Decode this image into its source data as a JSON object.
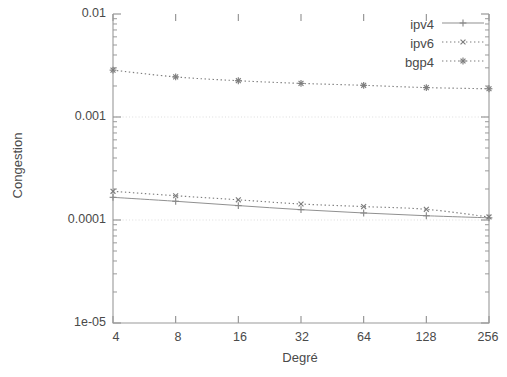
{
  "chart_data": {
    "type": "line",
    "title": "",
    "xlabel": "Degré",
    "ylabel": "Congestion",
    "xscale": "log2",
    "yscale": "log10",
    "xlim": [
      4,
      256
    ],
    "ylim": [
      1e-05,
      0.01
    ],
    "xticks": [
      "4",
      "8",
      "16",
      "32",
      "64",
      "128",
      "256"
    ],
    "x": [
      4,
      8,
      16,
      32,
      64,
      128,
      256
    ],
    "yticks": [
      "1e-05",
      "0.0001",
      "0.001",
      "0.01"
    ],
    "ytick_values": [
      1e-05,
      0.0001,
      0.001,
      0.01
    ],
    "grid": "horizontal-major-faint",
    "legend_position": "top-right-inside",
    "series": [
      {
        "name": "ipv4",
        "style": "solid",
        "marker": "plus",
        "color": "#8a8a8a",
        "values": [
          0.000166,
          0.000152,
          0.000138,
          0.000126,
          0.000117,
          0.00011,
          0.000105
        ]
      },
      {
        "name": "ipv6",
        "style": "dotted",
        "marker": "cross",
        "color": "#7d7d7d",
        "values": [
          0.00019,
          0.000172,
          0.000157,
          0.000143,
          0.000135,
          0.000127,
          0.000107
        ]
      },
      {
        "name": "bgp4",
        "style": "dotted",
        "marker": "star",
        "color": "#7d7d7d",
        "values": [
          0.00285,
          0.00245,
          0.00225,
          0.00212,
          0.00203,
          0.00193,
          0.00188
        ]
      }
    ]
  },
  "legend": {
    "entries": [
      {
        "label": "ipv4"
      },
      {
        "label": "ipv6"
      },
      {
        "label": "bgp4"
      }
    ]
  },
  "axes": {
    "x_title": "Degré",
    "y_title": "Congestion"
  }
}
